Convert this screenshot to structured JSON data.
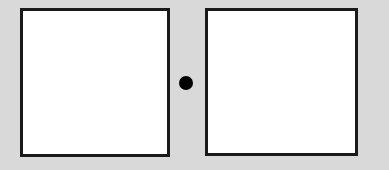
{
  "diagram": {
    "background_color": "#d9d9d9",
    "left_box": {
      "x": 20,
      "y": 8,
      "width": 150,
      "height": 149,
      "fill": "#ffffff",
      "stroke": "#1a1a1a"
    },
    "right_box": {
      "x": 205,
      "y": 8,
      "width": 153,
      "height": 148,
      "fill": "#ffffff",
      "stroke": "#1a1a1a"
    },
    "center_dot": {
      "cx": 186,
      "cy": 83,
      "r": 7,
      "fill": "#000000"
    }
  }
}
